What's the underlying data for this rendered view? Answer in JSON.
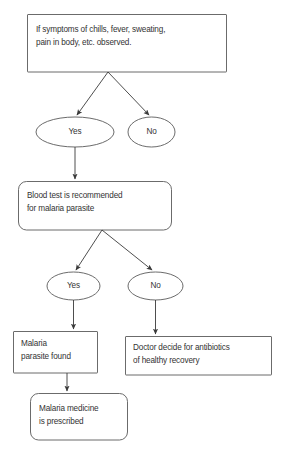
{
  "diagram": {
    "type": "flowchart",
    "background_color": "#ffffff",
    "line_color": "#3a3a3a",
    "text_color": "#333333",
    "nodes": [
      {
        "id": "symptoms",
        "shape": "rectangle",
        "label": "If symptoms of chills, fever, sweating,\npain in body, etc. observed."
      },
      {
        "id": "yes-1",
        "shape": "ellipse",
        "label": "Yes"
      },
      {
        "id": "no-1",
        "shape": "ellipse",
        "label": "No"
      },
      {
        "id": "blood-test",
        "shape": "rounded-rectangle",
        "label": "Blood test is recommended\nfor malaria parasite"
      },
      {
        "id": "yes-2",
        "shape": "ellipse",
        "label": "Yes"
      },
      {
        "id": "no-2",
        "shape": "ellipse",
        "label": "No"
      },
      {
        "id": "parasite-found",
        "shape": "rectangle",
        "label": "Malaria\nparasite found"
      },
      {
        "id": "antibiotics",
        "shape": "rectangle",
        "label": "Doctor decide for antibiotics\nof healthy recovery"
      },
      {
        "id": "medicine",
        "shape": "rounded-rectangle",
        "label": "Malaria medicine\nis prescribed"
      }
    ],
    "edges": [
      {
        "from": "symptoms",
        "to": "yes-1",
        "style": "arrow"
      },
      {
        "from": "symptoms",
        "to": "no-1",
        "style": "arrow"
      },
      {
        "from": "yes-1",
        "to": "blood-test",
        "style": "arrow"
      },
      {
        "from": "blood-test",
        "to": "yes-2",
        "style": "arrow"
      },
      {
        "from": "blood-test",
        "to": "no-2",
        "style": "arrow"
      },
      {
        "from": "yes-2",
        "to": "parasite-found",
        "style": "arrow"
      },
      {
        "from": "no-2",
        "to": "antibiotics",
        "style": "arrow"
      },
      {
        "from": "parasite-found",
        "to": "medicine",
        "style": "arrow"
      }
    ]
  }
}
